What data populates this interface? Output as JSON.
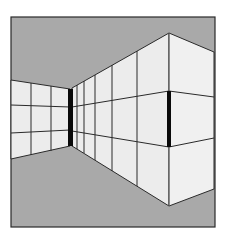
{
  "figure": {
    "colors": {
      "background": "#ffffff",
      "ceiling_floor": "#a9a9a9",
      "wall": "#ececec",
      "line": "#2a2a2a",
      "bar": "#0a0a0a"
    },
    "frame": {
      "x1": 11,
      "y1": 17,
      "x2": 215,
      "y2": 227
    },
    "left_wall": {
      "top": [
        [
          11,
          80
        ],
        [
          70,
          89
        ]
      ],
      "bottom": [
        [
          11,
          159
        ],
        [
          70,
          146
        ]
      ],
      "verticals_x": [
        31,
        51
      ],
      "horizontals": [
        [
          [
            11,
            105
          ],
          [
            70,
            107
          ]
        ],
        [
          [
            11,
            133
          ],
          [
            70,
            130
          ]
        ]
      ]
    },
    "concave_corner_bar": {
      "x": 68,
      "y": 89,
      "w": 5,
      "h": 57
    },
    "right_wall_near": {
      "top": [
        [
          72,
          88
        ],
        [
          169,
          33
        ]
      ],
      "bottom": [
        [
          72,
          146
        ],
        [
          169,
          206
        ]
      ],
      "verticals_x": [
        77,
        84,
        95,
        112,
        137
      ],
      "horizontals": [
        [
          [
            72,
            107
          ],
          [
            169,
            91
          ]
        ],
        [
          [
            72,
            131
          ],
          [
            169,
            147
          ]
        ]
      ]
    },
    "convex_corner_bar": {
      "x": 167,
      "y": 91,
      "w": 4,
      "h": 56
    },
    "right_wall_far": {
      "top": [
        [
          169,
          33
        ],
        [
          214,
          52
        ]
      ],
      "bottom": [
        [
          169,
          206
        ],
        [
          214,
          189
        ]
      ],
      "horizontals": [
        [
          [
            169,
            91
          ],
          [
            214,
            97
          ]
        ],
        [
          [
            169,
            147
          ],
          [
            214,
            138
          ]
        ]
      ]
    }
  }
}
